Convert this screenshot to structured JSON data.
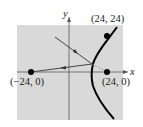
{
  "diagram": {
    "type": "hyperbola-reflection",
    "background_color": "#d9d9d9",
    "axes": {
      "x_label": "x",
      "y_label": "y"
    },
    "points": [
      {
        "id": "focus-left",
        "label": "(−24, 0)",
        "x": -24,
        "y": 0
      },
      {
        "id": "focus-right",
        "label": "(24, 0)",
        "x": 24,
        "y": 0
      },
      {
        "id": "curve-point",
        "label": "(24, 24)",
        "x": 24,
        "y": 24
      }
    ],
    "curve": {
      "kind": "hyperbola right branch",
      "color": "#000000"
    },
    "rays": [
      {
        "id": "incoming-ray",
        "description": "ray aimed at right focus (24, 0), reflected off hyperbola"
      },
      {
        "id": "reflected-ray",
        "description": "reflected ray travelling toward left focus (−24, 0)"
      }
    ]
  }
}
